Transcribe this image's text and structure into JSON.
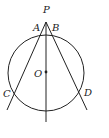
{
  "diagram": {
    "type": "geometry",
    "labels": {
      "P": "P",
      "A": "A",
      "B": "B",
      "O": "O",
      "C": "C",
      "D": "D"
    },
    "points": {
      "P": [
        46,
        23
      ],
      "A": [
        42,
        33
      ],
      "B": [
        50,
        33
      ],
      "O": [
        46,
        72
      ],
      "C": [
        13,
        92
      ],
      "D": [
        79,
        92
      ]
    },
    "circle": {
      "center": "O",
      "radius": 38
    },
    "lines": [
      "P-C (extended)",
      "P-D (extended)",
      "P-O (extended vertical)"
    ],
    "stroke_color": "#222222"
  }
}
